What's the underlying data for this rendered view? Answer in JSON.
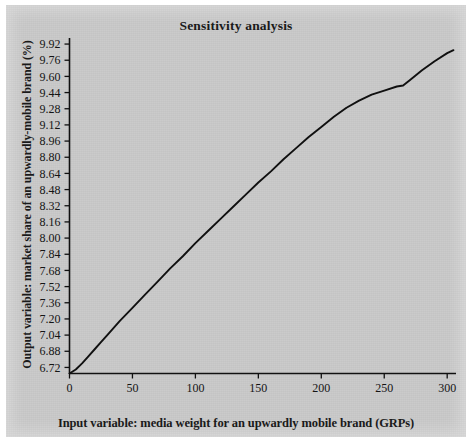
{
  "figure": {
    "background_color": "#c9c9c9",
    "page_color": "#ffffff",
    "line_color": "#101010"
  },
  "chart_data": {
    "type": "line",
    "title": "Sensitivity analysis",
    "xlabel": "Input variable: media weight for an upwardly mobile brand (GRPs)",
    "ylabel": "Output variable: market share of an upwardly-mobile brand (%)",
    "xlim": [
      0,
      307
    ],
    "ylim": [
      6.66,
      9.98
    ],
    "grid": false,
    "legend": null,
    "xticks": [
      0,
      50,
      100,
      150,
      200,
      250,
      300
    ],
    "xtick_labels": [
      "0",
      "50",
      "100",
      "150",
      "200",
      "250",
      "300"
    ],
    "yticks": [
      6.72,
      6.88,
      7.04,
      7.2,
      7.36,
      7.52,
      7.68,
      7.84,
      8.0,
      8.16,
      8.32,
      8.48,
      8.64,
      8.8,
      8.96,
      9.12,
      9.28,
      9.44,
      9.6,
      9.76,
      9.92
    ],
    "ytick_labels": [
      "6.72",
      "6.88",
      "7.04",
      "7.20",
      "7.36",
      "7.52",
      "7.68",
      "7.84",
      "8.00",
      "8.16",
      "8.32",
      "8.48",
      "8.64",
      "8.80",
      "8.96",
      "9.12",
      "9.28",
      "9.44",
      "9.60",
      "9.76",
      "9.92"
    ],
    "series": [
      {
        "name": "market share response",
        "x": [
          0,
          5,
          10,
          15,
          20,
          25,
          30,
          40,
          50,
          60,
          70,
          80,
          90,
          100,
          110,
          120,
          130,
          140,
          150,
          160,
          170,
          180,
          190,
          200,
          210,
          220,
          230,
          240,
          250,
          260,
          265,
          270,
          280,
          290,
          300,
          305
        ],
        "y": [
          6.66,
          6.7,
          6.76,
          6.83,
          6.9,
          6.97,
          7.04,
          7.18,
          7.31,
          7.44,
          7.57,
          7.7,
          7.82,
          7.95,
          8.07,
          8.19,
          8.31,
          8.43,
          8.55,
          8.66,
          8.78,
          8.89,
          9.0,
          9.1,
          9.2,
          9.29,
          9.36,
          9.42,
          9.46,
          9.5,
          9.51,
          9.56,
          9.66,
          9.75,
          9.83,
          9.86
        ]
      }
    ]
  }
}
